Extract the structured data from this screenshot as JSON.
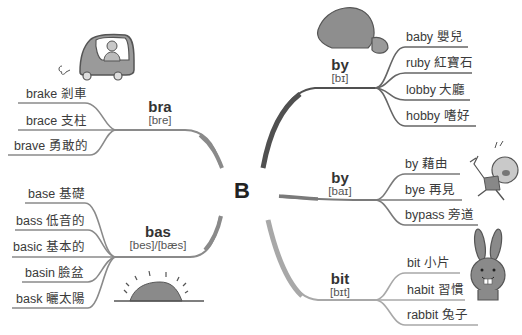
{
  "center_letter": "B",
  "colors": {
    "line_dark": "#555555",
    "line_mid": "#8a8a8a",
    "line_light": "#a8a8a8",
    "illustration_fill": "#8f8f8f"
  },
  "branches": [
    {
      "id": "bra",
      "word": "bra",
      "phonetic": "[bre]",
      "leaves": [
        "brake 剎車",
        "brace 支柱",
        "brave 勇敢的"
      ]
    },
    {
      "id": "bas",
      "word": "bas",
      "phonetic": "[bes]/[bæs]",
      "leaves": [
        "base 基礎",
        "bass 低音的",
        "basic 基本的",
        "basin 臉盆",
        "bask 曬太陽"
      ]
    },
    {
      "id": "by1",
      "word": "by",
      "phonetic": "[bɪ]",
      "leaves": [
        "baby 嬰兒",
        "ruby 紅寶石",
        "lobby 大廳",
        "hobby 嗜好"
      ]
    },
    {
      "id": "by2",
      "word": "by",
      "phonetic": "[baɪ]",
      "leaves": [
        "by 藉由",
        "bye 再見",
        "bypass 旁道"
      ]
    },
    {
      "id": "bit",
      "word": "bit",
      "phonetic": "[bɪt]",
      "leaves": [
        "bit 小片",
        "habit 習慣",
        "rabbit 兔子"
      ]
    }
  ],
  "illustrations": [
    "car-icon",
    "sunrise-icon",
    "rock-icon",
    "running-kid-icon",
    "rabbit-icon"
  ]
}
